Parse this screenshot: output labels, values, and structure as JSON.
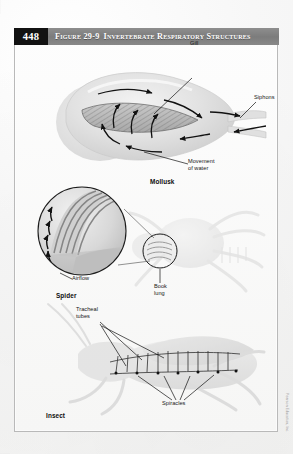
{
  "page": {
    "number": "448",
    "background_color": "#f4f4f3",
    "frame_color": "#b9b9b9"
  },
  "header": {
    "figure_label": "Figure 29-9",
    "title": "Invertebrate Respiratory Structures",
    "page_block_color": "#121212",
    "bar_color": "#828282",
    "text_color": "#ffffff"
  },
  "figure": {
    "caption_number": "29-9",
    "caption_title": "Invertebrate Respiratory Structures",
    "panels": [
      {
        "id": "mollusk",
        "organism": "Mollusk",
        "labels": [
          {
            "name": "gill",
            "text": "Gill"
          },
          {
            "name": "siphons",
            "text": "Siphons"
          },
          {
            "name": "movement-of-water",
            "text": "Movement\nof water"
          }
        ]
      },
      {
        "id": "spider",
        "organism": "Spider",
        "labels": [
          {
            "name": "airflow",
            "text": "Airflow"
          },
          {
            "name": "book-lung",
            "text": "Book\nlung"
          }
        ]
      },
      {
        "id": "insect",
        "organism": "Insect",
        "labels": [
          {
            "name": "tracheal-tubes",
            "text": "Tracheal\ntubes"
          },
          {
            "name": "spiracles",
            "text": "Spiracles"
          }
        ]
      }
    ]
  },
  "credit": {
    "text": "Pearson Education, Inc."
  }
}
